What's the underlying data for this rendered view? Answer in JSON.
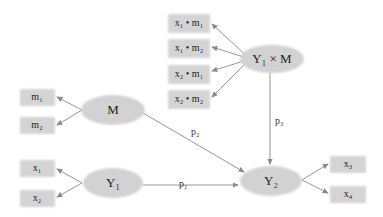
{
  "diagram": {
    "type": "path-model",
    "latent_nodes": [
      {
        "id": "M",
        "label": "M"
      },
      {
        "id": "Y1",
        "label": "Y₁"
      },
      {
        "id": "Y2",
        "label": "Y₂"
      },
      {
        "id": "Y1xM",
        "label": "Y₁ × M"
      }
    ],
    "indicators": {
      "M": [
        "m₁",
        "m₂"
      ],
      "Y1": [
        "x₁",
        "x₂"
      ],
      "Y2": [
        "x₃",
        "x₄"
      ],
      "Y1xM": [
        "x₁ • m₁",
        "x₁ • m₂",
        "x₂ • m₁",
        "x₂ • m₂"
      ]
    },
    "paths": [
      {
        "from": "Y1",
        "to": "Y2",
        "label": "p₁"
      },
      {
        "from": "M",
        "to": "Y2",
        "label": "p₂"
      },
      {
        "from": "Y1xM",
        "to": "Y2",
        "label": "p₃"
      }
    ]
  }
}
